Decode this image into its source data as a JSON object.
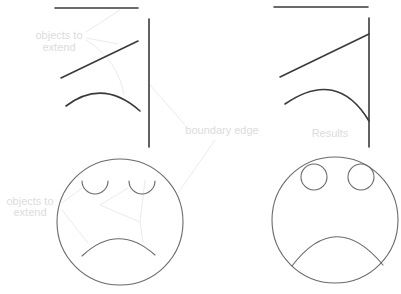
{
  "diagram": {
    "colors": {
      "background": "#ffffff",
      "geometry": "#3a3a3a",
      "face_outline": "#6a6a6a",
      "label": "#dcdcdc",
      "leader": "#ebebeb"
    },
    "labels": {
      "objects_to_extend_top_line1": "objects to",
      "objects_to_extend_top_line2": "extend",
      "boundary_edge": "boundary edge",
      "objects_to_extend_bottom_line1": "objects to",
      "objects_to_extend_bottom_line2": "extend",
      "results": "Results"
    },
    "panels": [
      {
        "name": "before-lines",
        "description": "Horizontal line, angled line and arc left of a vertical boundary edge, not touching it"
      },
      {
        "name": "after-lines",
        "description": "Angled line and arc extended to meet the vertical boundary edge"
      },
      {
        "name": "before-face",
        "description": "Circle face with open arc eyes and arc mouth not reaching the outline"
      },
      {
        "name": "after-face",
        "description": "Circle face with eyes closed into circles and mouth arc extended to meet the outline"
      }
    ]
  }
}
